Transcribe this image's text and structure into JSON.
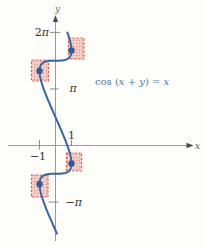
{
  "figure": {
    "background": "#fdfdfa",
    "width": 205,
    "height": 246
  },
  "chart_data": {
    "type": "line",
    "title": "cos (x + y) = x",
    "equation_segments": [
      {
        "text": "cos (",
        "italic": false
      },
      {
        "text": "x",
        "italic": true
      },
      {
        "text": " + ",
        "italic": false
      },
      {
        "text": "y",
        "italic": true
      },
      {
        "text": ") = ",
        "italic": false
      },
      {
        "text": "x",
        "italic": true
      }
    ],
    "equation_label_px": {
      "x": 95,
      "y": 85,
      "size": 10,
      "color": "#4779b4"
    },
    "origin_px": {
      "x": 55.5,
      "y": 145.5
    },
    "scale_px": {
      "x": 16,
      "y": 18
    },
    "curve": {
      "kind": "parametric",
      "x_of_t": "cos(t)",
      "y_of_t": "t - cos(t)",
      "t_min": -4.8,
      "t_max": 7.05,
      "step": 0.03,
      "color": "#3565a8",
      "width": 2
    },
    "axes": {
      "color": "#9a9a9a",
      "arrow_color": "#4a4a4a",
      "x": {
        "from_px": 8,
        "to_px": 187,
        "arrow_tip_px": 193.5,
        "label": "x",
        "label_px": {
          "x": 197.5,
          "y": 149,
          "size": 9,
          "color": "#555555"
        }
      },
      "y": {
        "from_px": 241,
        "to_px": 22,
        "arrow_tip_px": 15,
        "label": "y",
        "label_px": {
          "x": 57.5,
          "y": 12,
          "size": 9,
          "color": "#666666"
        }
      }
    },
    "tick_color": "#8a8a8a",
    "tick_label_color": "#333333",
    "tick_label_size": 11,
    "x_ticks": [
      {
        "value": -1,
        "label": "−1",
        "y1": -5.5,
        "y2": 4,
        "label_dx": -1.5,
        "label_dy": 14
      },
      {
        "value": 1,
        "label": "1",
        "y1": -5.5,
        "y2": 0.5,
        "label_dx": 0,
        "label_dy": -6.5
      }
    ],
    "y_ticks": [
      {
        "value": 6.2832,
        "label": "2π",
        "x1": -5.5,
        "x2": 5,
        "anchor": "end",
        "label_dx": -6.5
      },
      {
        "value": 3.1416,
        "label": "π",
        "x1": -5.5,
        "x2": 3,
        "anchor": "start",
        "label_dx": 14
      },
      {
        "value": -3.1416,
        "label": "−π",
        "x1": -7,
        "x2": 3,
        "anchor": "start",
        "label_dx": 10
      }
    ],
    "points": [
      {
        "x": 1,
        "y": 5.2832
      },
      {
        "x": -1,
        "y": 4.1416
      },
      {
        "x": 1,
        "y": -1
      },
      {
        "x": -1,
        "y": -2.1416
      }
    ],
    "point_color": "#2b5c9e",
    "point_radius": 3.2,
    "highlight_boxes": [
      {
        "x": 68.5,
        "y": 38,
        "w": 15.5,
        "h": 21
      },
      {
        "x": 31.5,
        "y": 60,
        "w": 17,
        "h": 21
      },
      {
        "x": 66.5,
        "y": 153,
        "w": 15,
        "h": 18
      },
      {
        "x": 31.5,
        "y": 175,
        "w": 16.5,
        "h": 22
      }
    ],
    "box_style": {
      "fill": "#f7d0c8",
      "dot": "#e5907e",
      "border": "#d95f4a",
      "dash": "2.2 1.8",
      "border_width": 1.2
    }
  }
}
